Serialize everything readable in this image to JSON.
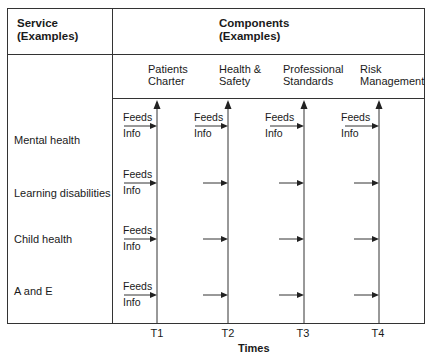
{
  "header": {
    "service_title_line1": "Service",
    "service_title_line2": "(Examples)",
    "components_title_line1": "Components",
    "components_title_line2": "(Examples)"
  },
  "components": [
    {
      "line1": "Patients",
      "line2": "Charter",
      "time": "T1"
    },
    {
      "line1": "Health &",
      "line2": "Safety",
      "time": "T2"
    },
    {
      "line1": "Professional",
      "line2": "Standards",
      "time": "T3"
    },
    {
      "line1": "Risk",
      "line2": "Management",
      "time": "T4"
    }
  ],
  "services": [
    {
      "label": "Mental health"
    },
    {
      "label": "Learning disabilities"
    },
    {
      "label": "Child health"
    },
    {
      "label": "A and E"
    }
  ],
  "flow_label": {
    "line1": "Feeds",
    "line2": "Info"
  },
  "axis": {
    "label": "Times"
  },
  "colors": {
    "line": "#333333",
    "text": "#1a1a1a",
    "background": "#ffffff"
  }
}
